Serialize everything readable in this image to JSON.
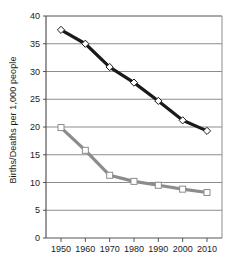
{
  "chart_data": {
    "type": "line",
    "title": "",
    "xlabel": "",
    "ylabel": "Births/Deaths per 1,000 people",
    "categories": [
      1950,
      1960,
      1970,
      1980,
      1990,
      2000,
      2010
    ],
    "x": [
      1950,
      1960,
      1970,
      1980,
      1990,
      2000,
      2010
    ],
    "xlim": [
      1945,
      2015
    ],
    "ylim": [
      0,
      40
    ],
    "y_ticks": [
      0,
      5,
      10,
      15,
      20,
      25,
      30,
      35,
      40
    ],
    "x_ticks": [
      "1950",
      "1960",
      "1970",
      "1980",
      "1990",
      "2000",
      "2010"
    ],
    "grid": "horizontal",
    "legend": "none",
    "series": [
      {
        "name": "Births",
        "marker": "diamond",
        "line_color": "#1a1a1a",
        "marker_fill": "#ffffff",
        "values": [
          37.5,
          35.0,
          30.8,
          28.0,
          24.7,
          21.2,
          19.3
        ]
      },
      {
        "name": "Deaths",
        "marker": "square",
        "line_color": "#8c8c8c",
        "marker_fill": "#ffffff",
        "values": [
          19.9,
          15.8,
          11.3,
          10.2,
          9.5,
          8.8,
          8.2
        ]
      }
    ]
  },
  "axis": {
    "y_title": "Births/Deaths per 1,000 people"
  }
}
